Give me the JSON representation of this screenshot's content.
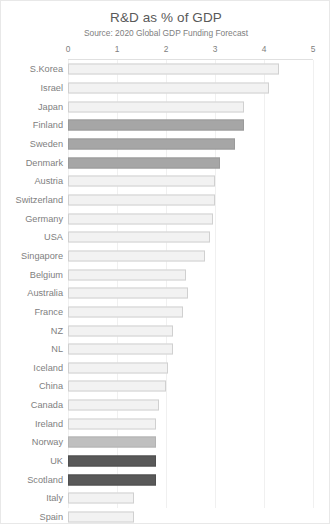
{
  "chart_data": {
    "type": "bar",
    "orientation": "horizontal",
    "title": "R&D as % of GDP",
    "subtitle": "Source: 2020 Global GDP Funding Forecast",
    "xlabel": "",
    "ylabel": "",
    "xlim": [
      0,
      5
    ],
    "xticks": [
      0,
      1,
      2,
      3,
      4,
      5
    ],
    "xtick_labels": [
      "0",
      "1",
      "2",
      "3",
      "4",
      "5"
    ],
    "grid": true,
    "grid_axis": "x",
    "legend": false,
    "categories": [
      "S.Korea",
      "Israel",
      "Japan",
      "Finland",
      "Sweden",
      "Denmark",
      "Austria",
      "Switzerland",
      "Germany",
      "USA",
      "Singapore",
      "Belgium",
      "Australia",
      "France",
      "NZ",
      "NL",
      "Iceland",
      "China",
      "Canada",
      "Ireland",
      "Norway",
      "UK",
      "Scotland",
      "Italy",
      "Spain"
    ],
    "values": [
      4.3,
      4.1,
      3.6,
      3.6,
      3.4,
      3.1,
      3.0,
      3.0,
      2.95,
      2.9,
      2.8,
      2.4,
      2.45,
      2.35,
      2.15,
      2.15,
      2.05,
      2.0,
      1.85,
      1.8,
      1.8,
      1.8,
      1.8,
      1.35,
      1.35
    ],
    "bar_styles": [
      "light",
      "light",
      "light",
      "mid",
      "mid",
      "mid",
      "light",
      "light",
      "light",
      "light",
      "light",
      "light",
      "light",
      "light",
      "light",
      "light",
      "light",
      "light",
      "light",
      "light",
      "midlight",
      "dark",
      "dark",
      "light",
      "light"
    ],
    "colors": {
      "light_fill": "#f2f2f2",
      "light_border": "#d0d0d0",
      "mid_fill": "#a6a6a6",
      "midlight_fill": "#bfbfbf",
      "dark_fill": "#595959",
      "grid": "#f0f0f0",
      "text": "#808080",
      "title_text": "#595959",
      "frame": "#e8e8e8"
    }
  }
}
